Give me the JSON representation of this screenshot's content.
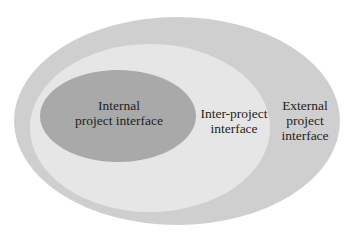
{
  "diagram": {
    "type": "nested-ellipses",
    "layers": [
      {
        "id": "external",
        "label_lines": [
          "External",
          "project",
          "interface"
        ],
        "fill": "#cfcfcf"
      },
      {
        "id": "inter",
        "label_lines": [
          "Inter-project",
          "interface"
        ],
        "fill": "#e6e6e6"
      },
      {
        "id": "internal",
        "label_lines": [
          "Internal",
          "project interface"
        ],
        "fill": "#a9a9a9"
      }
    ],
    "labels": {
      "internal_line1": "Internal",
      "internal_line2": "project interface",
      "inter_line1": "Inter-project",
      "inter_line2": "interface",
      "external_line1": "External",
      "external_line2": "project",
      "external_line3": "interface"
    }
  }
}
